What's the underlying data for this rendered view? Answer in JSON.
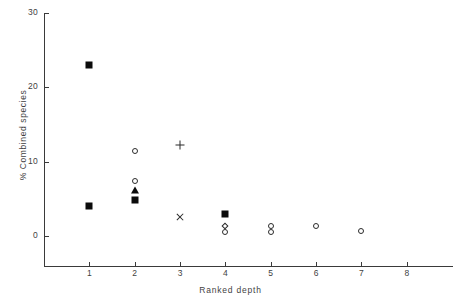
{
  "chart_data": {
    "type": "scatter",
    "title": "",
    "xlabel": "Ranked depth",
    "ylabel": "% Combined species",
    "xlim": [
      0,
      8.6
    ],
    "ylim": [
      0,
      30
    ],
    "xticks": [
      1,
      2,
      3,
      4,
      5,
      6,
      7,
      8
    ],
    "yticks": [
      0,
      10,
      20,
      30
    ],
    "xtick_labels": [
      "1",
      "2",
      "3",
      "4",
      "5",
      "6",
      "7",
      "8"
    ],
    "ytick_labels": [
      "0",
      "10",
      "20",
      "30"
    ],
    "grid": false,
    "legend": "none",
    "points": [
      {
        "x": 1,
        "y": 23.0,
        "marker": "filled-square"
      },
      {
        "x": 1,
        "y": 4.0,
        "marker": "filled-square"
      },
      {
        "x": 2,
        "y": 11.5,
        "marker": "open-circle"
      },
      {
        "x": 2,
        "y": 7.4,
        "marker": "open-circle"
      },
      {
        "x": 2,
        "y": 6.2,
        "marker": "filled-triangle"
      },
      {
        "x": 2,
        "y": 4.8,
        "marker": "filled-square"
      },
      {
        "x": 3,
        "y": 12.3,
        "marker": "plus"
      },
      {
        "x": 3,
        "y": 2.5,
        "marker": "cross"
      },
      {
        "x": 4,
        "y": 3.0,
        "marker": "filled-square"
      },
      {
        "x": 4,
        "y": 1.3,
        "marker": "open-diamond"
      },
      {
        "x": 4,
        "y": 0.6,
        "marker": "open-circle"
      },
      {
        "x": 5,
        "y": 1.4,
        "marker": "open-circle"
      },
      {
        "x": 5,
        "y": 0.5,
        "marker": "open-circle"
      },
      {
        "x": 6,
        "y": 1.3,
        "marker": "open-circle"
      },
      {
        "x": 7,
        "y": 0.7,
        "marker": "open-circle"
      }
    ]
  }
}
